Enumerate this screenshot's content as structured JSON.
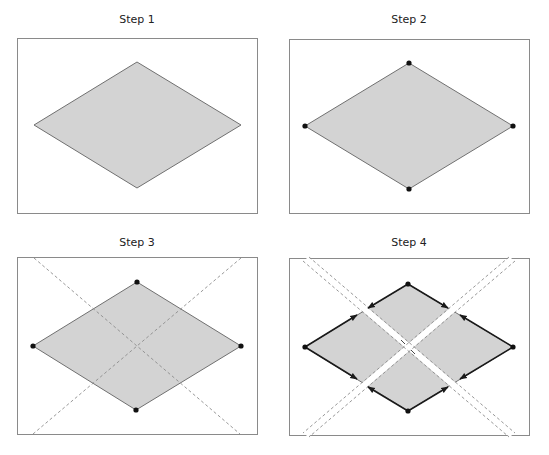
{
  "panels": [
    {
      "title": "Step 1",
      "description": "Filled rhombus"
    },
    {
      "title": "Step 2",
      "description": "Rhombus with vertex points marked"
    },
    {
      "title": "Step 3",
      "description": "Rhombus with vertex points and dashed diagonal extension lines crossing at center"
    },
    {
      "title": "Step 4",
      "description": "Rhombus split into four smaller rhombi along double dashed lines, with directed edges"
    }
  ],
  "colors": {
    "fill": "#d3d3d3",
    "outline": "#707070",
    "vertex": "#111111",
    "dashed": "#8c8c8c",
    "frame": "#8a8a8a"
  }
}
